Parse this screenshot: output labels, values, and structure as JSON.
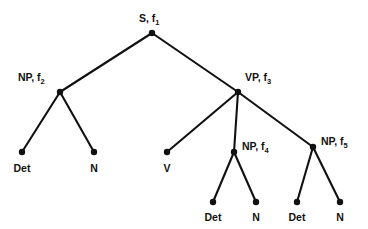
{
  "figure": {
    "background_color": "#ffffff",
    "ink_color": "#111111",
    "width": 368,
    "height": 229
  },
  "chart_data": {
    "type": "diagram",
    "subtype": "constituency-syntax-tree",
    "title": "",
    "nodes": [
      {
        "id": "s1",
        "label_text": "S",
        "subscript": "1",
        "label_prefix": "S, f",
        "label_full": "S, f1",
        "x": 152,
        "y": 33,
        "label_x": 139,
        "label_y": 22,
        "label_anchor": "start",
        "kind": "internal"
      },
      {
        "id": "np2",
        "label_text": "NP",
        "subscript": "2",
        "label_prefix": "NP, f",
        "label_full": "NP, f2",
        "x": 60,
        "y": 92,
        "label_x": 18,
        "label_y": 81,
        "label_anchor": "start",
        "kind": "internal"
      },
      {
        "id": "vp3",
        "label_text": "VP",
        "subscript": "3",
        "label_prefix": "VP, f",
        "label_full": "VP, f3",
        "x": 238,
        "y": 92,
        "label_x": 245,
        "label_y": 81,
        "label_anchor": "start",
        "kind": "internal"
      },
      {
        "id": "det1",
        "label_text": "Det",
        "subscript": "",
        "label_prefix": "Det",
        "label_full": "Det",
        "x": 22,
        "y": 152,
        "label_x": 22,
        "label_y": 172,
        "label_anchor": "middle",
        "kind": "leaf"
      },
      {
        "id": "n1",
        "label_text": "N",
        "subscript": "",
        "label_prefix": "N",
        "label_full": "N",
        "x": 94,
        "y": 152,
        "label_x": 94,
        "label_y": 172,
        "label_anchor": "middle",
        "kind": "leaf"
      },
      {
        "id": "v1",
        "label_text": "V",
        "subscript": "",
        "label_prefix": "V",
        "label_full": "V",
        "x": 167,
        "y": 152,
        "label_x": 167,
        "label_y": 172,
        "label_anchor": "middle",
        "kind": "leaf"
      },
      {
        "id": "np4",
        "label_text": "NP",
        "subscript": "4",
        "label_prefix": "NP, f",
        "label_full": "NP, f4",
        "x": 234,
        "y": 152,
        "label_x": 242,
        "label_y": 150,
        "label_anchor": "start",
        "kind": "internal"
      },
      {
        "id": "np5",
        "label_text": "NP",
        "subscript": "5",
        "label_prefix": "NP, f",
        "label_full": "NP, f5",
        "x": 313,
        "y": 147,
        "label_x": 321,
        "label_y": 145,
        "label_anchor": "start",
        "kind": "internal"
      },
      {
        "id": "det2",
        "label_text": "Det",
        "subscript": "",
        "label_prefix": "Det",
        "label_full": "Det",
        "x": 213,
        "y": 202,
        "label_x": 213,
        "label_y": 221,
        "label_anchor": "middle",
        "kind": "leaf"
      },
      {
        "id": "n2",
        "label_text": "N",
        "subscript": "",
        "label_prefix": "N",
        "label_full": "N",
        "x": 256,
        "y": 202,
        "label_x": 256,
        "label_y": 221,
        "label_anchor": "middle",
        "kind": "leaf"
      },
      {
        "id": "det3",
        "label_text": "Det",
        "subscript": "",
        "label_prefix": "Det",
        "label_full": "Det",
        "x": 297,
        "y": 202,
        "label_x": 297,
        "label_y": 221,
        "label_anchor": "middle",
        "kind": "leaf"
      },
      {
        "id": "n3",
        "label_text": "N",
        "subscript": "",
        "label_prefix": "N",
        "label_full": "N",
        "x": 340,
        "y": 202,
        "label_x": 340,
        "label_y": 221,
        "label_anchor": "middle",
        "kind": "leaf"
      }
    ],
    "edges": [
      {
        "from": "s1",
        "to": "np2",
        "x1": 152,
        "y1": 33,
        "x2": 60,
        "y2": 92
      },
      {
        "from": "s1",
        "to": "vp3",
        "x1": 152,
        "y1": 33,
        "x2": 238,
        "y2": 92
      },
      {
        "from": "np2",
        "to": "det1",
        "x1": 60,
        "y1": 92,
        "x2": 22,
        "y2": 152
      },
      {
        "from": "np2",
        "to": "n1",
        "x1": 60,
        "y1": 92,
        "x2": 94,
        "y2": 152
      },
      {
        "from": "vp3",
        "to": "v1",
        "x1": 238,
        "y1": 92,
        "x2": 167,
        "y2": 152
      },
      {
        "from": "vp3",
        "to": "np4",
        "x1": 238,
        "y1": 92,
        "x2": 234,
        "y2": 152
      },
      {
        "from": "vp3",
        "to": "np5",
        "x1": 238,
        "y1": 92,
        "x2": 313,
        "y2": 147
      },
      {
        "from": "np4",
        "to": "det2",
        "x1": 234,
        "y1": 152,
        "x2": 213,
        "y2": 202
      },
      {
        "from": "np4",
        "to": "n2",
        "x1": 234,
        "y1": 152,
        "x2": 256,
        "y2": 202
      },
      {
        "from": "np5",
        "to": "det3",
        "x1": 313,
        "y1": 147,
        "x2": 297,
        "y2": 202
      },
      {
        "from": "np5",
        "to": "n3",
        "x1": 313,
        "y1": 147,
        "x2": 340,
        "y2": 202
      }
    ],
    "node_radius": 3.2,
    "grid": false,
    "legend": null
  }
}
